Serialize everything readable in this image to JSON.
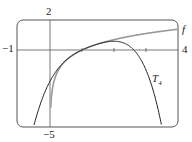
{
  "chart_data": {
    "type": "line",
    "title": "",
    "xlabel": "",
    "ylabel": "",
    "xlim": [
      -1,
      4
    ],
    "ylim": [
      -5,
      2
    ],
    "grid": false,
    "x_ticks": [
      1,
      2,
      3
    ],
    "corner_labels": {
      "x_min": "−1",
      "x_max": "4",
      "y_max": "2",
      "y_min": "−5"
    },
    "series": [
      {
        "name": "f",
        "label": "f",
        "function": "ln(x)",
        "color": "#999999",
        "x": [
          0.05,
          0.1,
          0.25,
          0.5,
          1,
          1.5,
          2,
          2.5,
          3,
          3.5,
          4
        ],
        "y": [
          -3.0,
          -2.3,
          -1.39,
          -0.69,
          0,
          0.41,
          0.69,
          0.92,
          1.1,
          1.25,
          1.39
        ]
      },
      {
        "name": "T4",
        "label": "T",
        "label_sub": "4",
        "function": "(x-1)-(x-1)^2/2+(x-1)^3/3-(x-1)^4/4",
        "color": "#222222",
        "x": [
          -0.5,
          0,
          0.5,
          1,
          1.5,
          2,
          2.5,
          3,
          3.5
        ],
        "y": [
          -5.02,
          -2.08,
          -0.68,
          0,
          0.4,
          0.58,
          0.47,
          -0.33,
          -5.19
        ]
      }
    ]
  }
}
